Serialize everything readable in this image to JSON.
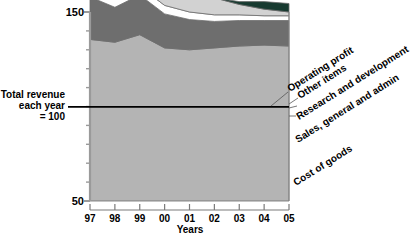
{
  "chart_data": {
    "type": "area",
    "title": "",
    "subtitle": "",
    "xlabel": "Years",
    "ylabel": "",
    "categories": [
      "97",
      "98",
      "99",
      "00",
      "01",
      "02",
      "03",
      "04",
      "05"
    ],
    "x": [
      1997,
      1998,
      1999,
      2000,
      2001,
      2002,
      2003,
      2004,
      2005
    ],
    "ylim": [
      50,
      150
    ],
    "yticks": [
      50,
      150
    ],
    "ytick_labels": [
      "50",
      "150"
    ],
    "gridlines": [
      60,
      70,
      80,
      90,
      100,
      110,
      120,
      130,
      140
    ],
    "grid": true,
    "legend_position": "right-rotated-callouts",
    "baseline_value": 100,
    "baseline_note": "Total revenue each year = 100",
    "stacked": true,
    "series": [
      {
        "name": "Cost of goods",
        "color": "#b4b4b4",
        "values": [
          85.5,
          84.0,
          88.0,
          81.0,
          80.0,
          81.0,
          82.0,
          82.5,
          82.0
        ]
      },
      {
        "name": "Sales, general and admin",
        "color": "#6e6e6e",
        "values": [
          22.5,
          18.5,
          21.0,
          18.0,
          16.0,
          14.0,
          13.5,
          13.0,
          13.5
        ]
      },
      {
        "name": "Research and development",
        "color": "#ffffff",
        "values": [
          5.0,
          4.5,
          4.5,
          4.5,
          4.0,
          3.5,
          3.0,
          2.5,
          2.5
        ]
      },
      {
        "name": "Other items",
        "color": "#d2d2d2",
        "values": [
          7.0,
          9.0,
          19.5,
          36.5,
          20.0,
          9.0,
          5.5,
          3.5,
          2.0
        ]
      },
      {
        "name": "Operating profit",
        "color": "#173a30",
        "values": [
          0.0,
          0.0,
          0.0,
          0.0,
          0.0,
          0.0,
          1.5,
          4.0,
          4.5
        ]
      }
    ],
    "cumulative_tops": {
      "cost_of_goods": [
        85.5,
        84.0,
        88.0,
        81.0,
        80.0,
        81.0,
        82.0,
        82.5,
        82.0
      ],
      "sales_general_admin": [
        108.0,
        102.5,
        109.0,
        99.0,
        96.0,
        95.0,
        95.5,
        95.5,
        95.5
      ],
      "research_and_development": [
        113.0,
        107.0,
        113.5,
        103.5,
        100.0,
        98.5,
        98.5,
        98.0,
        98.0
      ],
      "other_items": [
        120.0,
        116.0,
        133.0,
        140.0,
        120.0,
        107.5,
        104.0,
        101.5,
        100.0
      ],
      "operating_profit": [
        120.0,
        116.0,
        133.0,
        140.0,
        120.0,
        107.5,
        105.5,
        105.5,
        104.5
      ]
    }
  },
  "axis": {
    "y_top_label": "150",
    "y_bottom_label": "50",
    "x_title": "Years",
    "x_labels": [
      "97",
      "98",
      "99",
      "00",
      "01",
      "02",
      "03",
      "04",
      "05"
    ]
  },
  "baseline_label": {
    "line1": "Total revenue",
    "line2": "each year",
    "line3": "= 100"
  },
  "annotations": [
    {
      "label": "Operating profit"
    },
    {
      "label": "Other items"
    },
    {
      "label": "Research and development"
    },
    {
      "label": "Sales, general and admin"
    },
    {
      "label": "Cost of goods"
    }
  ],
  "colors": {
    "cost_of_goods": "#b4b4b4",
    "sales_general_admin": "#6e6e6e",
    "research_and_development": "#ffffff",
    "other_items": "#d2d2d2",
    "operating_profit": "#173a30",
    "axis": "#808080",
    "grid": "#c8c8c8",
    "baseline": "#000000"
  }
}
